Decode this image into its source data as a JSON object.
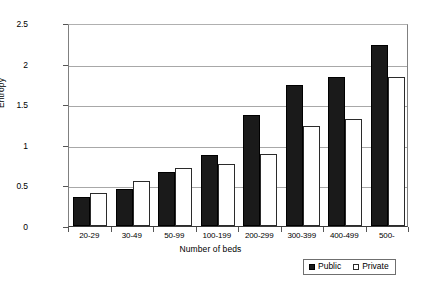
{
  "chart_data": {
    "type": "bar",
    "title": "",
    "xlabel": "Number of beds",
    "ylabel": "Entropy",
    "categories": [
      "20-29",
      "30-49",
      "50-99",
      "100-199",
      "200-299",
      "300-399",
      "400-499",
      "500-"
    ],
    "series": [
      {
        "name": "Public",
        "values": [
          0.36,
          0.46,
          0.66,
          0.88,
          1.37,
          1.74,
          1.83,
          2.23
        ],
        "color": "#1a1a1a"
      },
      {
        "name": "Private",
        "values": [
          0.41,
          0.56,
          0.71,
          0.76,
          0.89,
          1.23,
          1.32,
          1.83
        ],
        "color": "#ffffff"
      }
    ],
    "ylim": [
      0,
      2.5
    ],
    "yticks": [
      "0",
      "0.5",
      "1",
      "1.5",
      "2",
      "2.5"
    ],
    "ytick_values": [
      0,
      0.5,
      1,
      1.5,
      2,
      2.5
    ],
    "grid": true,
    "legend_position": "bottom-right"
  },
  "legend": {
    "entries": [
      {
        "label": "Public",
        "swatch": "filled-square-icon"
      },
      {
        "label": "Private",
        "swatch": "empty-square-icon"
      }
    ]
  }
}
